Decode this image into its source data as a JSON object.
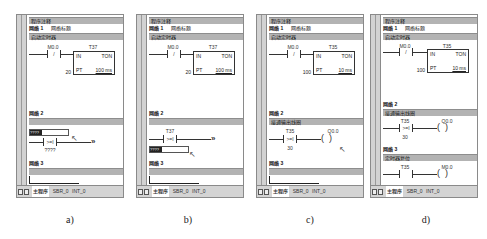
{
  "panels": [
    {
      "id": "a",
      "caption": "a)",
      "program_comment": "程序注释",
      "network1": {
        "label": "网络 1",
        "title": "网络标题",
        "comment": "启动定时器",
        "contact": "M0.0",
        "contact_symbol": "/",
        "timer": "T37",
        "timer_type": "TON",
        "in_label": "IN",
        "pt_label": "PT",
        "pt_value": "20",
        "time_base": "100 ms"
      },
      "network2": {
        "label": "网络 2",
        "comment": "",
        "compare_symbol": ">=I",
        "compare_operand_top": "",
        "compare_operand_bottom": "????",
        "cursor_label": "????"
      },
      "network3": {
        "label": "网络 3",
        "comment": ""
      },
      "tabs": [
        "主程序",
        "SBR_0",
        "INT_0"
      ]
    },
    {
      "id": "b",
      "caption": "b)",
      "program_comment": "程序注释",
      "network1": {
        "label": "网络 1",
        "title": "网络标题",
        "comment": "启动定时器",
        "contact": "M0.0",
        "contact_symbol": "/",
        "timer": "T37",
        "timer_type": "TON",
        "in_label": "IN",
        "pt_label": "PT",
        "pt_value": "20",
        "time_base": "100 ms"
      },
      "network2": {
        "label": "网络 2",
        "comment": "",
        "compare_symbol": ">=I",
        "compare_operand_top": "T37",
        "compare_operand_bottom": "",
        "cursor_label": "????"
      },
      "network3": {
        "label": "网络 3",
        "comment": ""
      },
      "tabs": [
        "主程序",
        "SBR_0",
        "INT_0"
      ]
    },
    {
      "id": "c",
      "caption": "c)",
      "program_comment": "程序注释",
      "network1": {
        "label": "网络 1",
        "title": "网络标题",
        "comment": "启动定时器",
        "contact": "M0.0",
        "contact_symbol": "/",
        "timer": "T35",
        "timer_type": "TON",
        "in_label": "IN",
        "pt_label": "PT",
        "pt_value": "100",
        "time_base": "10 ms"
      },
      "network2": {
        "label": "网络 2",
        "comment": "接通输出线圈",
        "compare_symbol": ">=I",
        "compare_operand_top": "T35",
        "compare_operand_bottom": "30",
        "coil": "Q0.0"
      },
      "network3": {
        "label": "网络 3",
        "comment": ""
      },
      "tabs": [
        "主程序",
        "SBR_0",
        "INT_0"
      ]
    },
    {
      "id": "d",
      "caption": "d)",
      "program_comment": "程序注释",
      "network1": {
        "label": "网络 1",
        "title": "网络标题",
        "comment": "启动定时器",
        "contact": "M0.0",
        "contact_symbol": "/",
        "timer": "T35",
        "timer_type": "TON",
        "in_label": "IN",
        "pt_label": "PT",
        "pt_value": "100",
        "time_base": "10 ms"
      },
      "network2": {
        "label": "网络 2",
        "comment": "接通输出线圈",
        "compare_symbol": ">=I",
        "compare_operand_top": "T35",
        "compare_operand_bottom": "30",
        "coil": "Q0.0"
      },
      "network3": {
        "label": "网络 3",
        "comment": "定时器复位",
        "contact": "T35",
        "coil": "M0.0"
      },
      "tabs": [
        "主程序",
        "SBR_0",
        "INT_0"
      ]
    }
  ]
}
